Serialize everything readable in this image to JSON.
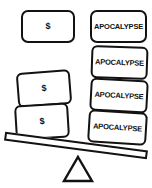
{
  "diagram": {
    "type": "balance-scale",
    "background_color": "#ffffff",
    "stroke_color": "#121212",
    "fill_color": "#ffffff",
    "tilt": "right-side-down",
    "heavier_side": "right"
  },
  "labels": {
    "money": "$",
    "apocalypse": "APOCALYPSE"
  },
  "floating_cards": [
    {
      "label": "$",
      "side": "left",
      "kind": "money"
    },
    {
      "label": "APOCALYPSE",
      "side": "right",
      "kind": "apocalypse"
    }
  ],
  "left_pan": {
    "side": "left",
    "position": "up",
    "count": 2,
    "cards": [
      {
        "label": "$",
        "kind": "money"
      },
      {
        "label": "$",
        "kind": "money"
      }
    ]
  },
  "right_pan": {
    "side": "right",
    "position": "down",
    "count": 3,
    "cards": [
      {
        "label": "APOCALYPSE",
        "kind": "apocalypse"
      },
      {
        "label": "APOCALYPSE",
        "kind": "apocalypse"
      },
      {
        "label": "APOCALYPSE",
        "kind": "apocalypse"
      }
    ]
  },
  "fulcrum": {
    "shape": "triangle",
    "filled": false
  }
}
